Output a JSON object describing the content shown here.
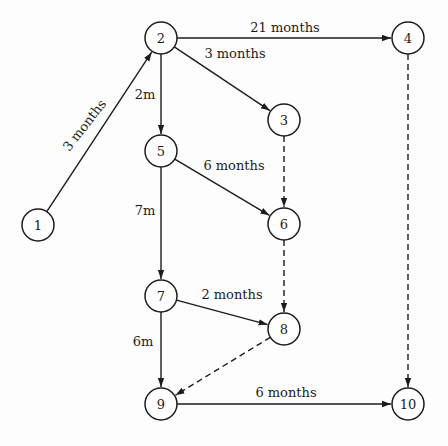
{
  "diagram": {
    "type": "activity-on-arrow network",
    "nodes": [
      {
        "id": "1",
        "label": "1",
        "x": 38,
        "y": 225
      },
      {
        "id": "2",
        "label": "2",
        "x": 161,
        "y": 38
      },
      {
        "id": "3",
        "label": "3",
        "x": 284,
        "y": 120
      },
      {
        "id": "4",
        "label": "4",
        "x": 408,
        "y": 38
      },
      {
        "id": "5",
        "label": "5",
        "x": 161,
        "y": 151
      },
      {
        "id": "6",
        "label": "6",
        "x": 284,
        "y": 224
      },
      {
        "id": "7",
        "label": "7",
        "x": 161,
        "y": 296
      },
      {
        "id": "8",
        "label": "8",
        "x": 284,
        "y": 329
      },
      {
        "id": "9",
        "label": "9",
        "x": 161,
        "y": 404
      },
      {
        "id": "10",
        "label": "10",
        "x": 408,
        "y": 404
      }
    ],
    "edges": [
      {
        "from": "1",
        "to": "2",
        "label": "3 months",
        "style": "solid",
        "lx": 88,
        "ly": 128,
        "rot": -52
      },
      {
        "from": "2",
        "to": "4",
        "label": "21 months",
        "style": "solid",
        "lx": 285,
        "ly": 32,
        "rot": 0
      },
      {
        "from": "2",
        "to": "3",
        "label": "3 months",
        "style": "solid",
        "lx": 235,
        "ly": 58,
        "rot": 0
      },
      {
        "from": "2",
        "to": "5",
        "label": "2m",
        "style": "solid",
        "lx": 145,
        "ly": 99,
        "rot": 0
      },
      {
        "from": "5",
        "to": "6",
        "label": "6 months",
        "style": "solid",
        "lx": 234,
        "ly": 170,
        "rot": 0
      },
      {
        "from": "5",
        "to": "7",
        "label": "7m",
        "style": "solid",
        "lx": 145,
        "ly": 215,
        "rot": 0
      },
      {
        "from": "3",
        "to": "6",
        "label": "",
        "style": "dashed"
      },
      {
        "from": "4",
        "to": "10",
        "label": "",
        "style": "dashed"
      },
      {
        "from": "7",
        "to": "8",
        "label": "2 months",
        "style": "solid",
        "lx": 232,
        "ly": 299,
        "rot": 0
      },
      {
        "from": "6",
        "to": "8",
        "label": "",
        "style": "dashed"
      },
      {
        "from": "7",
        "to": "9",
        "label": "6m",
        "style": "solid",
        "lx": 143,
        "ly": 346,
        "rot": 0
      },
      {
        "from": "8",
        "to": "9",
        "label": "",
        "style": "dashed"
      },
      {
        "from": "9",
        "to": "10",
        "label": "6 months",
        "style": "solid",
        "lx": 286,
        "ly": 397,
        "rot": 0
      }
    ],
    "node_radius": 16,
    "colors": {
      "stroke": "#1c1c1c",
      "background": "#fdfdfd",
      "node_fill": "#ffffff"
    }
  }
}
